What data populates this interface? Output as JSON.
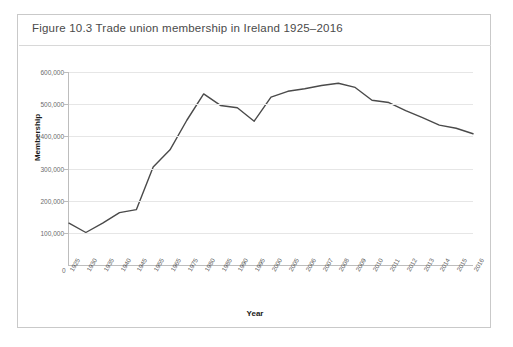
{
  "figure": {
    "caption": "Figure 10.3  Trade union membership in Ireland 1925–2016",
    "border_color": "#c9c9c9",
    "background": "#ffffff"
  },
  "chart_data": {
    "type": "line",
    "title": "Trade union membership in Ireland 1925–2016",
    "xlabel": "Year",
    "ylabel": "Membership",
    "line_color": "#4a4a4a",
    "grid": true,
    "legend": "none",
    "ylim": [
      0,
      600000
    ],
    "yticks": [
      0,
      100000,
      200000,
      300000,
      400000,
      500000,
      600000
    ],
    "ytick_labels": [
      "0",
      "100,000",
      "200,000",
      "300,000",
      "400,000",
      "500,000",
      "600,000"
    ],
    "categories": [
      "1925",
      "1930",
      "1935",
      "1940",
      "1945",
      "1955",
      "1965",
      "1975",
      "1980",
      "1985",
      "1990",
      "1995",
      "2000",
      "2005",
      "2006",
      "2007",
      "2008",
      "2009",
      "2010",
      "2011",
      "2012",
      "2013",
      "2014",
      "2015",
      "2016"
    ],
    "values": [
      130000,
      101000,
      130000,
      163000,
      172000,
      305000,
      358000,
      450000,
      532000,
      496000,
      489000,
      447000,
      522000,
      540000,
      548000,
      558000,
      565000,
      552000,
      512000,
      505000,
      480000,
      458000,
      435000,
      425000,
      408000
    ],
    "series": [
      {
        "name": "Trade union membership",
        "values": [
          130000,
          101000,
          130000,
          163000,
          172000,
          305000,
          358000,
          450000,
          532000,
          496000,
          489000,
          447000,
          522000,
          540000,
          548000,
          558000,
          565000,
          552000,
          512000,
          505000,
          480000,
          458000,
          435000,
          425000,
          408000
        ]
      }
    ],
    "annotations": {
      "peak_year": "2008",
      "peak_value": 565000,
      "min_year": "1930",
      "min_value": 101000
    }
  }
}
